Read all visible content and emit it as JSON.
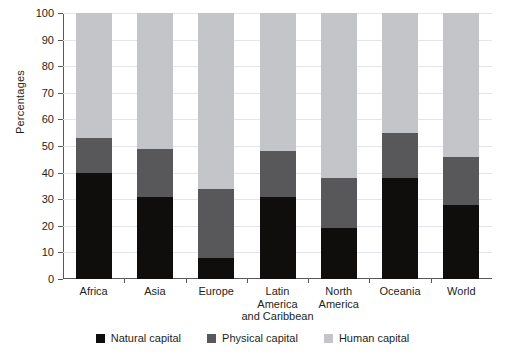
{
  "chart_data": {
    "type": "bar",
    "subtype": "stacked-percentage",
    "title": "",
    "xlabel": "",
    "ylabel": "Percentages",
    "ylim": [
      0,
      100
    ],
    "ytick_step": 10,
    "grid": true,
    "legend_position": "bottom",
    "categories": [
      "Africa",
      "Asia",
      "Europe",
      "Latin America and Caribbean",
      "North America",
      "Oceania",
      "World"
    ],
    "category_lines": [
      [
        "Africa"
      ],
      [
        "Asia"
      ],
      [
        "Europe"
      ],
      [
        "Latin",
        "America",
        "and Caribbean"
      ],
      [
        "North",
        "America"
      ],
      [
        "Oceania"
      ],
      [
        "World"
      ]
    ],
    "ytick_labels": [
      "0",
      "10",
      "20",
      "30",
      "40",
      "50",
      "60",
      "70",
      "80",
      "90",
      "100"
    ],
    "series": [
      {
        "name": "Natural capital",
        "color": "#100e0d",
        "values": [
          40,
          31,
          8,
          31,
          19,
          38,
          28
        ]
      },
      {
        "name": "Physical capital",
        "color": "#58585b",
        "values": [
          13,
          18,
          26,
          17,
          19,
          17,
          18
        ]
      },
      {
        "name": "Human capital",
        "color": "#c3c5c8",
        "values": [
          47,
          51,
          66,
          52,
          62,
          45,
          54
        ]
      }
    ],
    "cumulative_tops": {
      "natural": [
        40,
        31,
        8,
        31,
        19,
        38,
        28
      ],
      "physical": [
        53,
        49,
        34,
        48,
        38,
        55,
        46
      ],
      "human": [
        100,
        100,
        100,
        100,
        100,
        100,
        100
      ]
    }
  },
  "legend": {
    "items": [
      {
        "label": "Natural capital",
        "color": "#100e0d"
      },
      {
        "label": "Physical capital",
        "color": "#58585b"
      },
      {
        "label": "Human capital",
        "color": "#c3c5c8"
      }
    ]
  }
}
